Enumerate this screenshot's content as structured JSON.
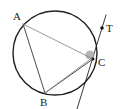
{
  "figure": {
    "canvas": {
      "width": 120,
      "height": 109,
      "background": "#ffffff"
    },
    "colors": {
      "circle_stroke": "#231f20",
      "chord_dark": "#4a4a4a",
      "chord_light": "#8c8c8c",
      "tangent_stroke": "#3a3a3a",
      "label_text": "#1b1b1b",
      "angle_marker_fill": "#a8a8a8",
      "point_marker_fill": "#151515"
    },
    "circle": {
      "cx": 55,
      "cy": 53,
      "r": 42,
      "stroke_width": 1.4
    },
    "points": [
      {
        "id": "A",
        "label": "A",
        "x": 23,
        "y": 24,
        "label_x": 13,
        "label_y": 20,
        "on_circle": true,
        "marker": false
      },
      {
        "id": "B",
        "label": "B",
        "x": 45,
        "y": 93,
        "label_x": 40,
        "label_y": 106,
        "on_circle": true,
        "marker": false
      },
      {
        "id": "C",
        "label": "C",
        "x": 93,
        "y": 59,
        "label_x": 98,
        "label_y": 66,
        "on_circle": true,
        "marker": true
      },
      {
        "id": "T",
        "label": "T",
        "x": 102,
        "y": 28,
        "label_x": 106,
        "label_y": 32,
        "on_circle": false,
        "marker": true
      }
    ],
    "chords": [
      {
        "id": "AC",
        "from": "A",
        "to": "C",
        "x1": 23,
        "y1": 24,
        "x2": 93,
        "y2": 59,
        "shade": "light",
        "width": 0.9
      },
      {
        "id": "AB",
        "from": "A",
        "to": "B",
        "x1": 23,
        "y1": 24,
        "x2": 45,
        "y2": 93,
        "shade": "dark",
        "width": 1.0
      },
      {
        "id": "BC",
        "from": "B",
        "to": "C",
        "x1": 45,
        "y1": 93,
        "x2": 93,
        "y2": 59,
        "shade": "dark",
        "width": 1.0
      },
      {
        "id": "BC2",
        "from": "B",
        "to": "C",
        "x1": 45,
        "y1": 93,
        "x2": 93,
        "y2": 57,
        "shade": "light",
        "width": 0.8
      }
    ],
    "tangent": {
      "id": "tangent-at-C",
      "label": "T",
      "x1": 106,
      "y1": 15,
      "x2": 77,
      "y2": 109,
      "width": 1.0,
      "touch_point": "C"
    },
    "angle_marker": {
      "id": "angle-at-C",
      "center_x": 90,
      "center_y": 55,
      "radius": 4.6,
      "note": "shaded angle between chord and tangent at C"
    }
  }
}
